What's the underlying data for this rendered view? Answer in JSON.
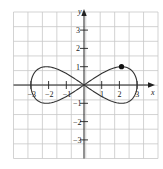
{
  "chart_data": {
    "type": "line",
    "title": "",
    "xlabel": "x",
    "ylabel": "y",
    "xlim": [
      -4.6,
      4.0
    ],
    "ylim": [
      -4.0,
      4.0
    ],
    "grid": true,
    "legend": null,
    "x_ticks": [
      -3,
      -2,
      -1,
      1,
      2,
      3
    ],
    "x_tick_labels": [
      "-3",
      "-2",
      "-1",
      "1",
      "2",
      "3"
    ],
    "y_ticks": [
      3,
      2,
      1,
      -1,
      -2,
      -3
    ],
    "y_tick_labels": [
      "3",
      "2",
      "1",
      "-1",
      "-2",
      "-3"
    ],
    "series": [
      {
        "name": "figure-eight curve",
        "parametric": "x = 3cos(t), y = sin(2t)",
        "x": [
          3,
          2.77,
          2.12,
          1.15,
          0,
          -1.15,
          -2.12,
          -2.77,
          -3,
          -2.77,
          -2.12,
          -1.15,
          0,
          1.15,
          2.12,
          2.77,
          3
        ],
        "y": [
          0,
          0.71,
          1,
          0.71,
          0,
          -0.71,
          -1,
          -0.71,
          0,
          0.71,
          1,
          0.71,
          0,
          -0.71,
          -1,
          -0.71,
          0
        ]
      }
    ],
    "annotations": [
      {
        "type": "point",
        "x": 2.12,
        "y": 1,
        "label": ""
      }
    ]
  },
  "axes": {
    "x_label": "x",
    "y_label": "y",
    "x_tick_labels": [
      "−3",
      "−2",
      "−1",
      "1",
      "2",
      "3"
    ],
    "y_tick_labels": [
      "3",
      "2",
      "1",
      "−1",
      "−2",
      "−3"
    ]
  },
  "colors": {
    "grid": "#c8c8c8",
    "axis": "#222222",
    "curve": "#333333",
    "point": "#111111"
  }
}
